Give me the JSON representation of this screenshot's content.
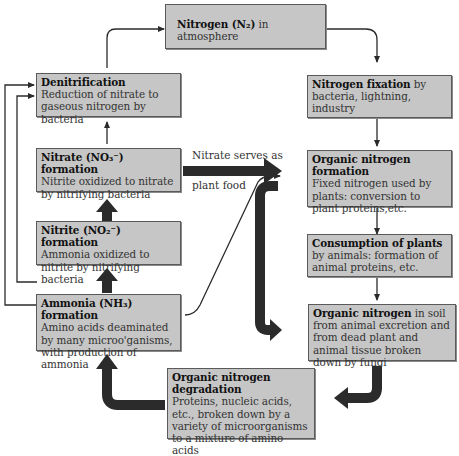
{
  "diagram": {
    "colors": {
      "box_fill": "#c6c6c6",
      "box_border": "#5a5a5a",
      "arrow": "#2b2b2b",
      "background": "#ffffff"
    },
    "nodes": {
      "atmosphere": {
        "heading": "Nitrogen (N₂)",
        "body": " in atmosphere"
      },
      "denitrification": {
        "heading": "Denitrification",
        "body": " Reduction of nitrate to gaseous nitrogen by bacteria"
      },
      "fixation": {
        "heading": "Nitrogen fixation",
        "body": " by bacteria, lightning, industry"
      },
      "nitrate": {
        "heading": "Nitrate (NO₃⁻) formation",
        "body": "Nitrite oxidized to nitrate by nitrifying bacteria"
      },
      "organic_formation": {
        "heading": "Organic nitrogen formation",
        "body": "Fixed nitrogen used by plants: conversion to plant proteins,etc."
      },
      "nitrite": {
        "heading": "Nitrite (NO₂⁻) formation",
        "body": "Ammonia oxidized to nitrite by nitrifying bacteria"
      },
      "consumption": {
        "heading": "Consumption of plants",
        "body": " by animals: formation of animal proteins, etc."
      },
      "ammonia": {
        "heading": "Ammonia (NH₃) formation",
        "body": "Amino acids deaminated by many microo'ganisms, with production of ammonia"
      },
      "organic_soil": {
        "heading": "Organic nitrogen",
        "body": " in soil from animal excretion and from dead plant and animal tissue broken down by fungi"
      },
      "degradation": {
        "heading": "Organic nitrogen degradation",
        "body": "Proteins, nucleic acids, etc., broken down by a variety of microorganisms to a mixture of amino acids"
      }
    },
    "edge_labels": {
      "nitrate_to_plants_top": "Nitrate serves as",
      "nitrate_to_plants_bottom": "plant food"
    }
  }
}
